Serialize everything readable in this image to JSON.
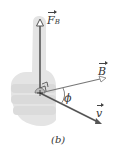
{
  "diagram": {
    "labels": {
      "force": {
        "symbol": "F",
        "subscript": "B"
      },
      "field": {
        "symbol": "B"
      },
      "velocity": {
        "symbol": "v"
      },
      "angle": "ϕ",
      "caption": "(b)"
    },
    "colors": {
      "hand": "#e3e3e3",
      "arrow": "#555555",
      "text": "#333333"
    }
  }
}
